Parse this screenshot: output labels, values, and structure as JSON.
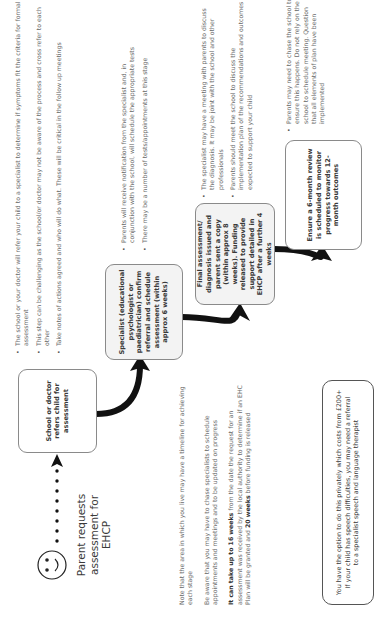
{
  "diagram": {
    "orientation": "rotated-90-ccw",
    "start": {
      "icon": "smiley-face-icon",
      "label": "Parent requests assessment for EHCP"
    },
    "steps": [
      {
        "id": "school",
        "text": "School or doctor refers child for assessment",
        "bullets": [
          "The school or your doctor will refer your child to a specialist to determine if symptoms fit the criteria for formal assessment",
          "This step can be challenging as the school/or doctor may not be aware of the process and cross refer to each other",
          "Take notes of actions agreed and who will do what. These will be critical in the follow up meetings"
        ]
      },
      {
        "id": "specialist",
        "text": "Specialist (educational psychologist or paediatrician) confirm referral and schedule assessment (within approx 6 weeks)",
        "bullets": [
          "Parents will receive notification from the specialist and, in conjunction with the school, will schedule the appropriate tests",
          "There may be a number of tests/appointments at this stage"
        ]
      },
      {
        "id": "final",
        "text": "Final assessment/ diagnosis issued and parent sent a copy (within approx 8 weeks). Funding released to provide support detailed in EHCP after a further 4 weeks",
        "bullets": [
          "The specialist may have a meeting with parents to discuss the diagnosis. It may be joint with the school and other professionals",
          "Parents should meet the school to discuss the implementation plan of the recommendations and outcomes expected to support your child"
        ]
      },
      {
        "id": "review",
        "text": "Ensure a 6-month review is scheduled to monitor progress towards 12-month outcomes",
        "bullets": [
          "Parents may need to chase the school to ensure this happens. Do not rely on the school to schedule meeting. Question that all elements of plan have been implemented"
        ]
      }
    ],
    "notes": {
      "note1": "Note that the area in which you live may have a timeline for achieving each stage",
      "note2": "Be aware that you may have to chase specialists to schedule appointments and meetings and to be updated on progress",
      "note3_bold_a": "It can take up to 16 weeks",
      "note3_mid": " from the date the request for an assessment was received by the local authority to determine if an EHC Plan will be granted and ",
      "note3_bold_b": "20 weeks",
      "note3_end": " before funding is released"
    },
    "private_option": {
      "line1": "You have the option to do this privately which costs from £200+",
      "line2": "If your child has speech difficulties, you may need a referral",
      "line3": "to a specialist speech and language therapist"
    },
    "colors": {
      "arrow": "#111111",
      "box_fill": "#f3f3f3",
      "box_border": "#8a8a8a",
      "text": "#6a6a6a",
      "heading_text": "#3a3a3a"
    }
  }
}
